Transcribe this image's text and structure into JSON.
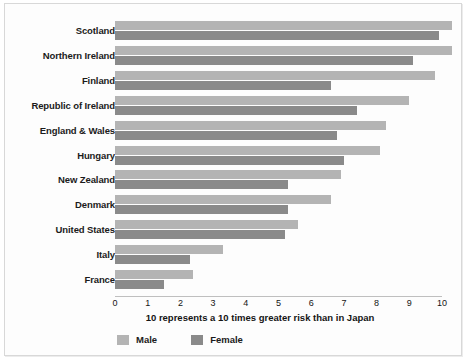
{
  "chart_data": {
    "type": "bar",
    "orientation": "horizontal",
    "title": "",
    "xlabel": "10 represents a 10 times greater risk than in Japan",
    "ylabel": "",
    "xlim": [
      0,
      10
    ],
    "xticks": [
      0,
      1,
      2,
      3,
      4,
      5,
      6,
      7,
      8,
      9,
      10
    ],
    "xtick_labels": [
      "0",
      "1",
      "2",
      "3",
      "4",
      "5",
      "6",
      "7",
      "8",
      "9",
      "10"
    ],
    "grid": false,
    "legend_position": "bottom-left",
    "categories": [
      "Scotland",
      "Northern Ireland",
      "Finland",
      "Republic of Ireland",
      "England & Wales",
      "Hungary",
      "New Zealand",
      "Denmark",
      "United States",
      "Italy",
      "France"
    ],
    "series": [
      {
        "name": "Male",
        "color": "#b4b4b4",
        "values": [
          10.3,
          10.3,
          9.8,
          9.0,
          8.3,
          8.1,
          6.9,
          6.6,
          5.6,
          3.3,
          2.4
        ]
      },
      {
        "name": "Female",
        "color": "#8a8a8a",
        "values": [
          9.9,
          9.1,
          6.6,
          7.4,
          6.8,
          7.0,
          5.3,
          5.3,
          5.2,
          2.3,
          1.5
        ]
      }
    ]
  },
  "legend": {
    "items": [
      {
        "label": "Male",
        "color": "#b4b4b4"
      },
      {
        "label": "Female",
        "color": "#8a8a8a"
      }
    ]
  }
}
